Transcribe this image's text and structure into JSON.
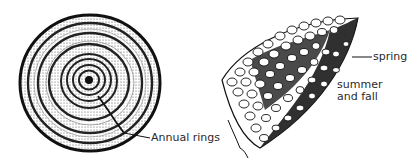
{
  "figure": {
    "left_panel": {
      "subject": "tree-trunk-cross-section",
      "label": "Annual rings",
      "ring_count": 8
    },
    "right_panel": {
      "subject": "magnified-wood-cells",
      "labels": {
        "spring": "spring",
        "summer_line1": "summer",
        "summer_line2": "and fall"
      }
    }
  },
  "colors": {
    "ink": "#1a1a1a",
    "background": "#ffffff"
  }
}
